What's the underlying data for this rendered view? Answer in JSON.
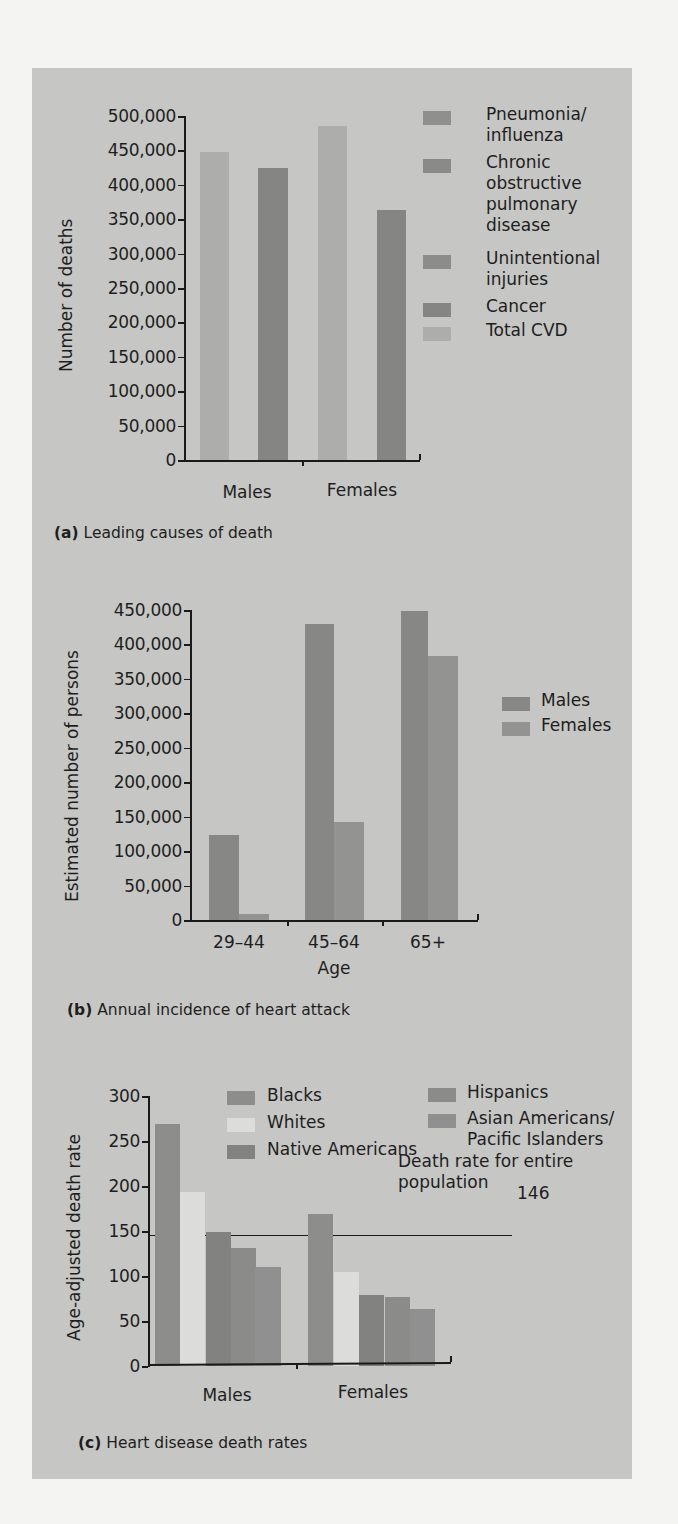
{
  "page": {
    "background": "#f4f4f2",
    "panel_color": "#c6c6c4"
  },
  "colors": {
    "total_cvd": "#adadab",
    "cancer": "#858584",
    "unintentional_injuries": "#8c8c8b",
    "copd": "#8a8a89",
    "pneumonia": "#8f8f8e",
    "males_b": "#878786",
    "females_b": "#939392",
    "blacks": "#8d8d8c",
    "whites": "#dcdcdb",
    "native_americans": "#828281",
    "hispanics": "#8b8b8a",
    "asian_pi": "#909090"
  },
  "chart_data": [
    {
      "id": "a",
      "type": "bar",
      "title": "Leading causes of death",
      "caption_letter": "(a)",
      "caption_text": "Leading causes of death",
      "xlabel": "",
      "ylabel": "Number of deaths",
      "ylim": [
        0,
        500000
      ],
      "yticks": [
        "0",
        "50,000",
        "100,000",
        "150,000",
        "200,000",
        "250,000",
        "300,000",
        "350,000",
        "400,000",
        "450,000",
        "500,000"
      ],
      "categories": [
        "Males",
        "Females"
      ],
      "series": [
        {
          "name": "Total CVD",
          "values": [
            447000,
            486000
          ]
        },
        {
          "name": "Cancer",
          "values": [
            424000,
            364000
          ]
        }
      ],
      "legend": [
        "Pneumonia/ influenza",
        "Chronic obstructive pulmonary disease",
        "Unintentional injuries",
        "Cancer",
        "Total CVD"
      ],
      "legend_position": "right",
      "grid": false
    },
    {
      "id": "b",
      "type": "bar",
      "title": "Annual incidence of heart attack",
      "caption_letter": "(b)",
      "caption_text": "Annual incidence of heart attack",
      "xlabel": "Age",
      "ylabel": "Estimated number of persons",
      "ylim": [
        0,
        450000
      ],
      "yticks": [
        "0",
        "50,000",
        "100,000",
        "150,000",
        "200,000",
        "250,000",
        "300,000",
        "350,000",
        "400,000",
        "450,000"
      ],
      "categories": [
        "29–44",
        "45–64",
        "65+"
      ],
      "series": [
        {
          "name": "Males",
          "values": [
            123000,
            430000,
            449000
          ]
        },
        {
          "name": "Females",
          "values": [
            8000,
            142000,
            383000
          ]
        }
      ],
      "legend": [
        "Males",
        "Females"
      ],
      "legend_position": "right",
      "grid": false
    },
    {
      "id": "c",
      "type": "bar",
      "title": "Heart disease death rates",
      "caption_letter": "(c)",
      "caption_text": "Heart disease death rates",
      "xlabel": "",
      "ylabel": "Age-adjusted death rate",
      "ylim": [
        0,
        300
      ],
      "yticks": [
        "0",
        "50",
        "100",
        "150",
        "200",
        "250",
        "300"
      ],
      "categories": [
        "Males",
        "Females"
      ],
      "series": [
        {
          "name": "Blacks",
          "values": [
            269,
            169
          ]
        },
        {
          "name": "Whites",
          "values": [
            193,
            104
          ]
        },
        {
          "name": "Native Americans",
          "values": [
            149,
            79
          ]
        },
        {
          "name": "Hispanics",
          "values": [
            131,
            77
          ]
        },
        {
          "name": "Asian Americans/ Pacific Islanders",
          "values": [
            110,
            63
          ]
        }
      ],
      "legend": [
        "Blacks",
        "Whites",
        "Native Americans",
        "Hispanics",
        "Asian Americans/ Pacific Islanders"
      ],
      "legend_position": "top",
      "reference_line": {
        "value": 146,
        "label": "146",
        "annotation_line1": "Death rate for entire",
        "annotation_line2": "population"
      },
      "grid": false
    }
  ],
  "legend_a": {
    "pneumonia_l1": "Pneumonia/",
    "pneumonia_l2": "influenza",
    "copd_l1": "Chronic",
    "copd_l2": "obstructive",
    "copd_l3": "pulmonary",
    "copd_l4": "disease",
    "injuries_l1": "Unintentional",
    "injuries_l2": "injuries",
    "cancer": "Cancer",
    "total_cvd": "Total CVD"
  },
  "legend_c": {
    "asian_l1": "Asian Americans/",
    "asian_l2": "Pacific Islanders"
  }
}
